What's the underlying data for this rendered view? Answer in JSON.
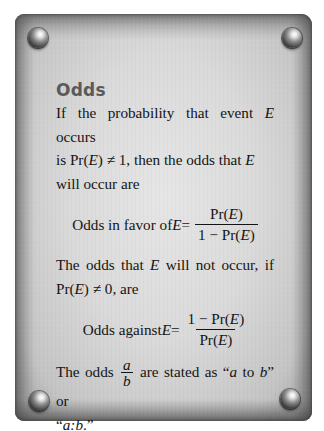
{
  "card": {
    "title": "Odds",
    "para1": {
      "line1_a": "If the probability that event ",
      "line1_var": "E",
      "line1_b": " occurs",
      "line2_a": "is Pr(",
      "line2_var": "E",
      "line2_b": ") ≠ 1, then the odds that ",
      "line2_var2": "E",
      "line3": "will occur are"
    },
    "formula_in_favor": {
      "lhs": "Odds in favor of ",
      "lhs_var": "E",
      "equals": " =",
      "numerator_a": "Pr(",
      "numerator_var": "E",
      "numerator_b": ")",
      "denominator_a": "1 − Pr(",
      "denominator_var": "E",
      "denominator_b": ")"
    },
    "para2": {
      "line1_a": "The odds that ",
      "line1_var": "E",
      "line1_b": " will not occur, if",
      "line2_a": "Pr(",
      "line2_var": "E",
      "line2_b": ") ≠ 0, are"
    },
    "formula_against": {
      "lhs": "Odds against ",
      "lhs_var": "E",
      "equals": " =",
      "numerator_a": "1 − Pr(",
      "numerator_var": "E",
      "numerator_b": ")",
      "denominator_a": "Pr(",
      "denominator_var": "E",
      "denominator_b": ")"
    },
    "para3": {
      "prefix": "The odds ",
      "frac_num": "a",
      "frac_den": "b",
      "mid": " are stated as “",
      "a_var": "a",
      "to": " to ",
      "b_var": "b",
      "suffix": "” or",
      "line2_open": "“",
      "line2_expr": "a:b",
      "line2_close": ".”"
    }
  },
  "colors": {
    "title": "#5a5a5a",
    "body_text": "#141414",
    "plate": "#dadada",
    "background": "#ffffff"
  },
  "icons": [
    "screw-icon",
    "screw-icon",
    "screw-icon",
    "screw-icon"
  ]
}
